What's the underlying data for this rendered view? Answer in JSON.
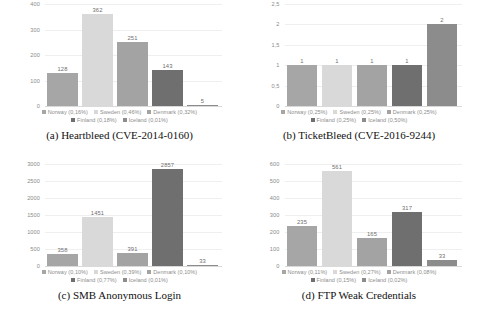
{
  "figure": {
    "countries": [
      "Norway",
      "Sweden",
      "Denmark",
      "Finland",
      "Iceland"
    ],
    "colors": [
      "#a6a6a6",
      "#d9d9d9",
      "#a3a3a3",
      "#6f6f6f",
      "#8c8c8c"
    ]
  },
  "chart_data": [
    {
      "type": "bar",
      "panel": "a",
      "caption": "(a) Heartbleed (CVE-2014-0160)",
      "title": "",
      "xlabel": "",
      "ylabel": "",
      "categories": [
        "Norway",
        "Sweden",
        "Denmark",
        "Finland",
        "Iceland"
      ],
      "values": [
        128,
        362,
        251,
        143,
        5
      ],
      "value_labels": [
        "128",
        "362",
        "251",
        "143",
        "5"
      ],
      "yticks": [
        "0",
        "100",
        "200",
        "300",
        "400"
      ],
      "ytick_values": [
        0,
        100,
        200,
        300,
        400
      ],
      "ylim": [
        0,
        400
      ],
      "grid": true,
      "legend_position": "bottom",
      "legend": [
        "Norway (0,16%)",
        "Sweden (0,46%)",
        "Denmark (0,32%)",
        "Finland  (0,18%)",
        "Iceland (0,01%)"
      ]
    },
    {
      "type": "bar",
      "panel": "b",
      "caption": "(b) TicketBleed (CVE-2016-9244)",
      "title": "",
      "xlabel": "",
      "ylabel": "",
      "categories": [
        "Norway",
        "Sweden",
        "Denmark",
        "Finland",
        "Iceland"
      ],
      "values": [
        1,
        1,
        1,
        1,
        2
      ],
      "value_labels": [
        "1",
        "1",
        "1",
        "1",
        "2"
      ],
      "yticks": [
        "0",
        "0,5",
        "1",
        "1,5",
        "2",
        "2,5"
      ],
      "ytick_values": [
        0,
        0.5,
        1,
        1.5,
        2,
        2.5
      ],
      "ylim": [
        0,
        2.5
      ],
      "grid": true,
      "legend_position": "bottom",
      "legend": [
        "Norway (0,25%)",
        "Sweden (0,25%)",
        "Denmark (0,25%)",
        "Finland (0,25%)",
        "Iceland (0,50%)"
      ]
    },
    {
      "type": "bar",
      "panel": "c",
      "caption": "(c) SMB Anonymous Login",
      "title": "",
      "xlabel": "",
      "ylabel": "",
      "categories": [
        "Norway",
        "Sweden",
        "Denmark",
        "Finland",
        "Iceland"
      ],
      "values": [
        358,
        1451,
        391,
        2857,
        33
      ],
      "value_labels": [
        "358",
        "1451",
        "391",
        "2857",
        "33"
      ],
      "yticks": [
        "0",
        "500",
        "1000",
        "1500",
        "2000",
        "2500",
        "3000"
      ],
      "ytick_values": [
        0,
        500,
        1000,
        1500,
        2000,
        2500,
        3000
      ],
      "ylim": [
        0,
        3000
      ],
      "grid": true,
      "legend_position": "bottom",
      "legend": [
        "Norway (0,10%)",
        "Sweden (0,39%)",
        "Denmark (0,10%)",
        "Finland (0,77%)",
        "Iceland (0,01%)"
      ]
    },
    {
      "type": "bar",
      "panel": "d",
      "caption": "(d) FTP Weak Credentials",
      "title": "",
      "xlabel": "",
      "ylabel": "",
      "categories": [
        "Norway",
        "Sweden",
        "Denmark",
        "Finland",
        "Iceland"
      ],
      "values": [
        235,
        561,
        165,
        317,
        33
      ],
      "value_labels": [
        "235",
        "561",
        "165",
        "317",
        "33"
      ],
      "yticks": [
        "0",
        "100",
        "200",
        "300",
        "400",
        "500",
        "600"
      ],
      "ytick_values": [
        0,
        100,
        200,
        300,
        400,
        500,
        600
      ],
      "ylim": [
        0,
        600
      ],
      "grid": true,
      "legend_position": "bottom",
      "legend": [
        "Norway (0,11%)",
        "Sweden (0,27%)",
        "Denmark (0,08%)",
        "Finland (0,15%)",
        "Iceland (0,02%)"
      ]
    }
  ]
}
